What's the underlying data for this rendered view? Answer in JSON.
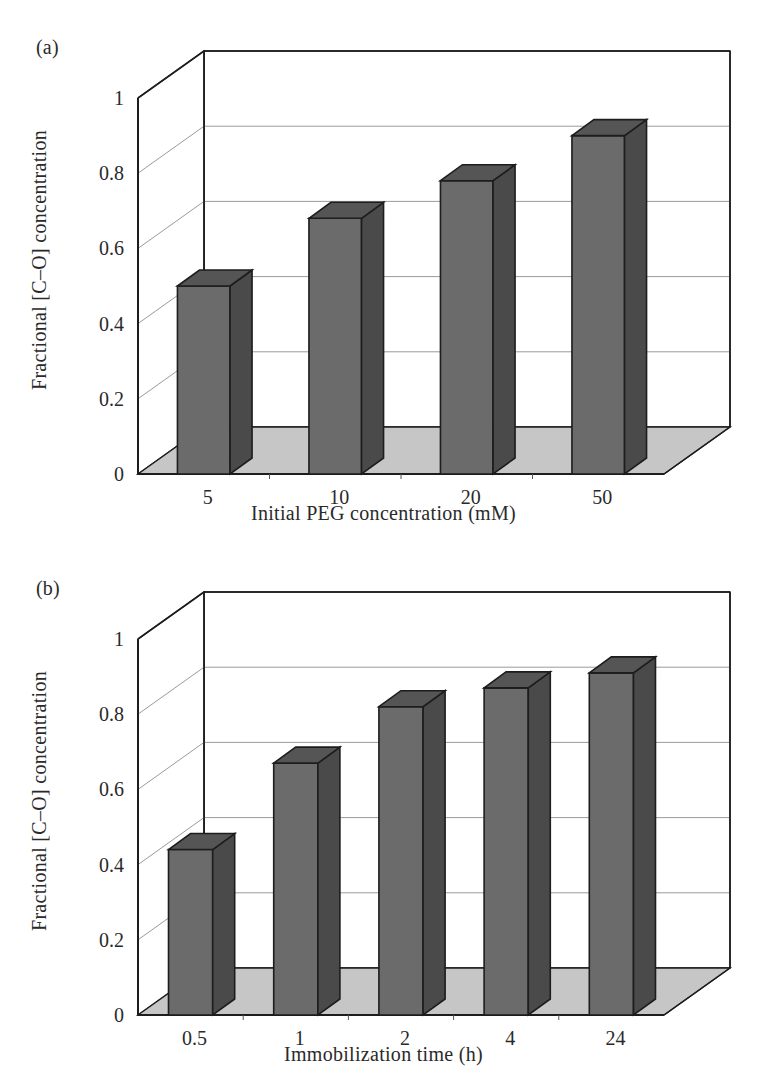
{
  "figure": {
    "panels": [
      {
        "letter": "(a)",
        "y_axis_title": "Fractional [C–O] concentration",
        "x_axis_title": "Initial PEG concentration (mM)",
        "y_ticks": [
          "0",
          "0.2",
          "0.4",
          "0.6",
          "0.8",
          "1"
        ],
        "x_ticks": [
          "5",
          "10",
          "20",
          "50"
        ]
      },
      {
        "letter": "(b)",
        "y_axis_title": "Fractional [C–O] concentration",
        "x_axis_title": "Immobilization time (h)",
        "y_ticks": [
          "0",
          "0.2",
          "0.4",
          "0.6",
          "0.8",
          "1"
        ],
        "x_ticks": [
          "0.5",
          "1",
          "2",
          "4",
          "24"
        ]
      }
    ]
  },
  "chart_data": [
    {
      "type": "bar",
      "panel": "(a)",
      "title": "",
      "categories": [
        "5",
        "10",
        "20",
        "50"
      ],
      "values": [
        0.5,
        0.68,
        0.78,
        0.9
      ],
      "xlabel": "Initial PEG concentration (mM)",
      "ylabel": "Fractional [C–O] concentration",
      "ylim": [
        0,
        1
      ],
      "ytick_values": [
        0,
        0.2,
        0.4,
        0.6,
        0.8,
        1
      ],
      "grid": true,
      "legend": "none",
      "style": "3d-column",
      "bar_face_color": "#6b6b6b",
      "bar_top_color": "#555555",
      "bar_side_color": "#4a4a4a",
      "floor_color": "#c6c6c6",
      "wall_color": "#ffffff"
    },
    {
      "type": "bar",
      "panel": "(b)",
      "title": "",
      "categories": [
        "0.5",
        "1",
        "2",
        "4",
        "24"
      ],
      "values": [
        0.44,
        0.67,
        0.82,
        0.87,
        0.91
      ],
      "xlabel": "Immobilization time (h)",
      "ylabel": "Fractional [C–O] concentration",
      "ylim": [
        0,
        1
      ],
      "ytick_values": [
        0,
        0.2,
        0.4,
        0.6,
        0.8,
        1
      ],
      "grid": true,
      "legend": "none",
      "style": "3d-column",
      "bar_face_color": "#6b6b6b",
      "bar_top_color": "#555555",
      "bar_side_color": "#4a4a4a",
      "floor_color": "#c6c6c6",
      "wall_color": "#ffffff"
    }
  ]
}
